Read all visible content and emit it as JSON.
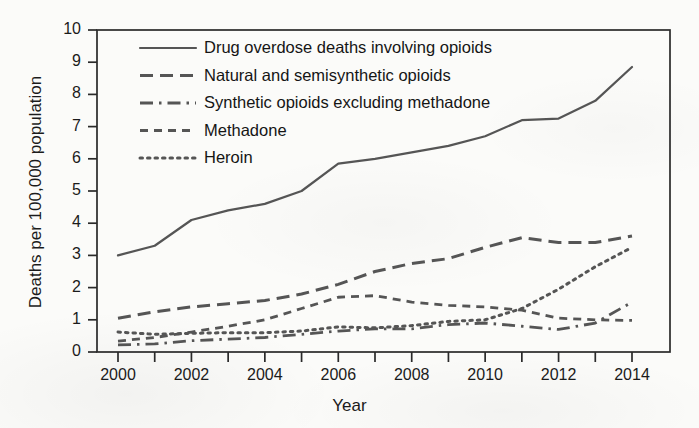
{
  "figure": {
    "name": "opioid-overdose-death-rates-line-chart",
    "background_color": "#fbfbf9",
    "ink_color": "#555555",
    "text_color": "#1b1b1b"
  },
  "axes": {
    "x_title": "Year",
    "y_title": "Deaths per 100,000 population",
    "y_ticks": [
      "0",
      "1",
      "2",
      "3",
      "4",
      "5",
      "6",
      "7",
      "8",
      "9",
      "10"
    ],
    "x_ticks": [
      "2000",
      "2002",
      "2004",
      "2006",
      "2008",
      "2010",
      "2012",
      "2014"
    ],
    "x_minor_ticks": [
      "2001",
      "2003",
      "2005",
      "2007",
      "2009",
      "2011",
      "2013"
    ]
  },
  "legend": {
    "position": "top-left-inside",
    "entries": [
      {
        "label": "Drug overdose deaths involving opioids",
        "style": "solid",
        "swatch": "legend-swatch-solid"
      },
      {
        "label": "Natural and semisynthetic opioids",
        "style": "dashed",
        "swatch": "legend-swatch-dashed"
      },
      {
        "label": "Synthetic opioids excluding methadone",
        "style": "dashdot",
        "swatch": "legend-swatch-dashdot"
      },
      {
        "label": "Methadone",
        "style": "shortdash",
        "swatch": "legend-swatch-shortdash"
      },
      {
        "label": "Heroin",
        "style": "dotted",
        "swatch": "legend-swatch-dotted"
      }
    ]
  },
  "chart_data": {
    "type": "line",
    "title": "",
    "subtitle": "",
    "xlabel": "Year",
    "ylabel": "Deaths per 100,000 population",
    "xlim": [
      2000,
      2014
    ],
    "ylim": [
      0,
      10
    ],
    "grid": false,
    "legend_position": "upper left",
    "x": [
      2000,
      2001,
      2002,
      2003,
      2004,
      2005,
      2006,
      2007,
      2008,
      2009,
      2010,
      2011,
      2012,
      2013,
      2014
    ],
    "series": [
      {
        "name": "Drug overdose deaths involving opioids",
        "style": "solid",
        "values": [
          3.0,
          3.3,
          4.1,
          4.4,
          4.6,
          5.0,
          5.85,
          6.0,
          6.2,
          6.4,
          6.7,
          7.2,
          7.25,
          7.8,
          8.85
        ]
      },
      {
        "name": "Natural and semisynthetic opioids",
        "style": "dashed",
        "values": [
          1.05,
          1.25,
          1.4,
          1.5,
          1.6,
          1.8,
          2.1,
          2.5,
          2.75,
          2.9,
          3.25,
          3.55,
          3.4,
          3.4,
          3.6
        ]
      },
      {
        "name": "Synthetic opioids excluding methadone",
        "style": "dashdot",
        "values": [
          0.22,
          0.25,
          0.35,
          0.4,
          0.45,
          0.55,
          0.65,
          0.72,
          0.72,
          0.85,
          0.9,
          0.8,
          0.7,
          0.9,
          1.55
        ]
      },
      {
        "name": "Methadone",
        "style": "shortdash",
        "values": [
          0.34,
          0.45,
          0.62,
          0.8,
          1.0,
          1.35,
          1.7,
          1.75,
          1.55,
          1.45,
          1.4,
          1.3,
          1.05,
          1.0,
          0.98
        ]
      },
      {
        "name": "Heroin",
        "style": "dotted",
        "values": [
          0.62,
          0.55,
          0.58,
          0.6,
          0.6,
          0.65,
          0.78,
          0.75,
          0.82,
          0.95,
          1.0,
          1.35,
          1.95,
          2.65,
          3.25
        ]
      }
    ]
  }
}
